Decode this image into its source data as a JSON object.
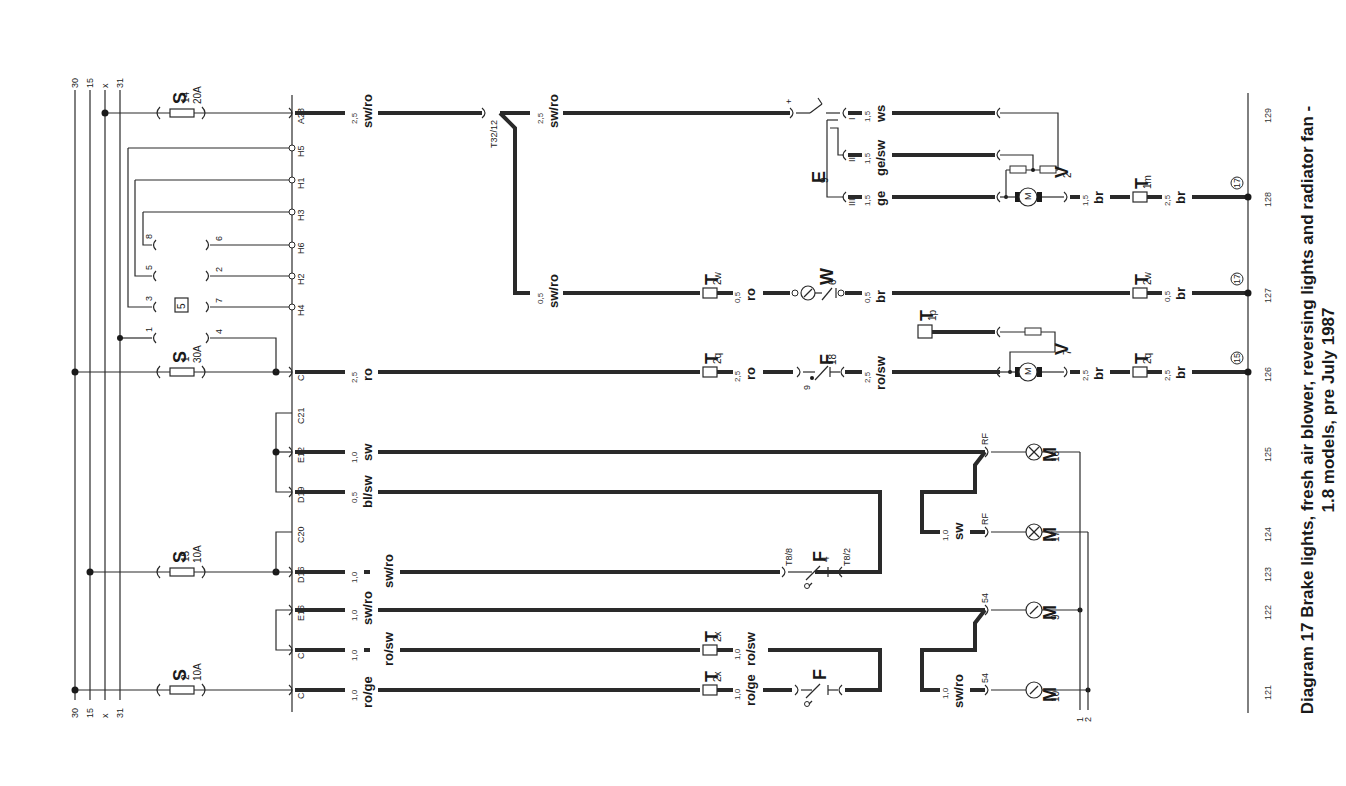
{
  "caption": {
    "line1": "Diagram 17  Brake lights, fresh air blower, reversing lights and radiator fan -",
    "line2": "1.8 models, pre July 1987"
  },
  "bus_lines": [
    {
      "label": "30",
      "x": 75
    },
    {
      "label": "15",
      "x": 90
    },
    {
      "label": "x",
      "x": 105
    },
    {
      "label": "31",
      "x": 120
    }
  ],
  "fuses": [
    {
      "name": "S14",
      "main": "S",
      "sub": "14",
      "rating": "20A",
      "y": 113
    },
    {
      "name": "S1",
      "main": "S",
      "sub": "1",
      "rating": "30A",
      "y": 372
    },
    {
      "name": "S15",
      "main": "S",
      "sub": "15",
      "rating": "10A",
      "y": 572
    },
    {
      "name": "S2",
      "main": "S",
      "sub": "2",
      "rating": "10A",
      "y": 690
    }
  ],
  "relay": {
    "label": "5",
    "pins": [
      "1",
      "3",
      "5",
      "8",
      "4",
      "7",
      "2",
      "6"
    ]
  },
  "connectors": [
    {
      "label": "A23",
      "y": 113
    },
    {
      "label": "H5",
      "y": 148
    },
    {
      "label": "H1",
      "y": 180
    },
    {
      "label": "H3",
      "y": 212
    },
    {
      "label": "H6",
      "y": 245
    },
    {
      "label": "H2",
      "y": 276
    },
    {
      "label": "H4",
      "y": 307
    },
    {
      "label": "C7",
      "y": 372
    },
    {
      "label": "C21",
      "y": 413
    },
    {
      "label": "E12",
      "y": 452
    },
    {
      "label": "D19",
      "y": 492
    },
    {
      "label": "C20",
      "y": 532
    },
    {
      "label": "D16",
      "y": 572
    },
    {
      "label": "E16",
      "y": 610
    },
    {
      "label": "C1",
      "y": 650
    },
    {
      "label": "C3",
      "y": 690
    }
  ],
  "wires": [
    {
      "id": "a23",
      "size": "2,5",
      "color": "sw/ro"
    },
    {
      "id": "t32",
      "size": "2,5",
      "color": "sw/ro"
    },
    {
      "id": "t32b",
      "size": "0,5",
      "color": "sw/ro"
    },
    {
      "id": "c7",
      "size": "2,5",
      "color": "ro"
    },
    {
      "id": "e12",
      "size": "1,0",
      "color": "sw"
    },
    {
      "id": "d19",
      "size": "0,5",
      "color": "bl/sw"
    },
    {
      "id": "d16",
      "size": "1,0",
      "color": "sw/ro"
    },
    {
      "id": "e16",
      "size": "1,0",
      "color": "sw/ro"
    },
    {
      "id": "c1",
      "size": "1,0",
      "color": "ro/sw"
    },
    {
      "id": "c3",
      "size": "1,0",
      "color": "ro/ge"
    },
    {
      "id": "w6a",
      "size": "0,5",
      "color": "ro"
    },
    {
      "id": "w6b",
      "size": "0,5",
      "color": "br"
    },
    {
      "id": "f18a",
      "size": "2,5",
      "color": "ro"
    },
    {
      "id": "f18b",
      "size": "2,5",
      "color": "ro/sw"
    },
    {
      "id": "e9i",
      "size": "1,5",
      "color": "ws"
    },
    {
      "id": "e9ii",
      "size": "1,5",
      "color": "ge/sw"
    },
    {
      "id": "e9iii",
      "size": "1,5",
      "color": "ge"
    },
    {
      "id": "v2",
      "size": "1,5",
      "color": "br"
    },
    {
      "id": "v2g",
      "size": "2,5",
      "color": "br"
    },
    {
      "id": "w6g",
      "size": "0,5",
      "color": "br"
    },
    {
      "id": "v7",
      "size": "2,5",
      "color": "br"
    },
    {
      "id": "v7g",
      "size": "2,5",
      "color": "br"
    },
    {
      "id": "c1b",
      "size": "1,0",
      "color": "ro/sw"
    },
    {
      "id": "c3b",
      "size": "1,0",
      "color": "ro/ge"
    },
    {
      "id": "m17",
      "size": "1,0",
      "color": "sw"
    },
    {
      "id": "m10",
      "size": "1,0",
      "color": "sw/ro"
    }
  ],
  "connector_pins": {
    "t32_12": "T32/12",
    "t8_8": "T8/8",
    "t8_2": "T8/2",
    "plus": "+",
    "pin9": "9",
    "rf1": "RF",
    "rf2": "RF",
    "p54a": "54",
    "p54b": "54"
  },
  "components": {
    "E9": {
      "main": "E",
      "sub": "9",
      "positions": [
        "I",
        "II",
        "III"
      ]
    },
    "V2": {
      "main": "V",
      "sub": "2"
    },
    "V7": {
      "main": "V",
      "sub": "7"
    },
    "W6": {
      "main": "W",
      "sub": "6"
    },
    "F18": {
      "main": "F",
      "sub": "18"
    },
    "F4": {
      "main": "F",
      "sub": "4"
    },
    "F": {
      "main": "F",
      "sub": ""
    },
    "M16": {
      "main": "M",
      "sub": "16"
    },
    "M17": {
      "main": "M",
      "sub": "17"
    },
    "M9": {
      "main": "M",
      "sub": "9"
    },
    "M10": {
      "main": "M",
      "sub": "10"
    },
    "T2w_a": {
      "main": "T",
      "sub": "2w"
    },
    "T2w_b": {
      "main": "T",
      "sub": "2w"
    },
    "T2q_a": {
      "main": "T",
      "sub": "2q"
    },
    "T2q_b": {
      "main": "T",
      "sub": "2q"
    },
    "T2x_a": {
      "main": "T",
      "sub": "2x"
    },
    "T2x_b": {
      "main": "T",
      "sub": "2x"
    },
    "T1m": {
      "main": "T",
      "sub": "1m"
    },
    "T1p": {
      "main": "T",
      "sub": "1p"
    },
    "motor_symbol": "M"
  },
  "earth_points": [
    {
      "label": "17",
      "y": 197
    },
    {
      "label": "17",
      "y": 293
    },
    {
      "label": "15",
      "y": 372
    }
  ],
  "earth_bus_labels": {
    "a": "1",
    "b": "2"
  },
  "grid_refs": [
    {
      "label": "121",
      "y": 690
    },
    {
      "label": "122",
      "y": 610
    },
    {
      "label": "123",
      "y": 572
    },
    {
      "label": "124",
      "y": 532
    },
    {
      "label": "125",
      "y": 452
    },
    {
      "label": "126",
      "y": 372
    },
    {
      "label": "127",
      "y": 293
    },
    {
      "label": "128",
      "y": 197
    },
    {
      "label": "129",
      "y": 113
    }
  ]
}
